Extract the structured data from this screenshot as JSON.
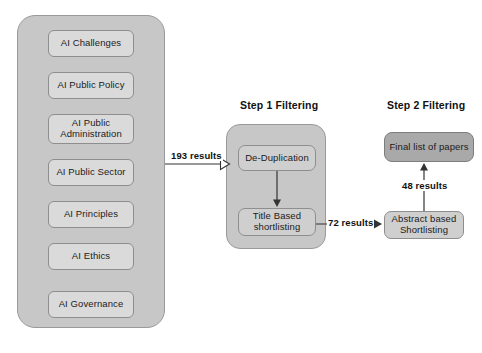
{
  "diagram": {
    "colors": {
      "group_fill": "#c7c7c7",
      "group_border": "#9a9a9a",
      "topic_fill": "#dadada",
      "process_fill": "#cfcfcf",
      "final_fill": "#a9a9a9",
      "box_border": "#8e8e8e",
      "text": "#1b1b1b",
      "line": "#333333",
      "background": "#ffffff"
    },
    "search_group": {
      "name": "search-terms-group",
      "items": [
        {
          "label": "AI Challenges"
        },
        {
          "label": "AI Public Policy"
        },
        {
          "label": "AI Public\nAdministration"
        },
        {
          "label": "AI Public Sector"
        },
        {
          "label": "AI Principles"
        },
        {
          "label": "AI Ethics"
        },
        {
          "label": "AI Governance"
        }
      ]
    },
    "step1": {
      "title": "Step 1 Filtering",
      "nodes": [
        {
          "label": "De-Duplication"
        },
        {
          "label": "Title Based\nshortlisting"
        }
      ]
    },
    "step2": {
      "title": "Step 2 Filtering",
      "nodes": [
        {
          "label": "Final list of papers"
        },
        {
          "label": "Abstract based\nShortlisting"
        }
      ]
    },
    "edges": [
      {
        "name": "edge-193-results",
        "label": "193 results",
        "arrow": "hollow",
        "direction": "right"
      },
      {
        "name": "edge-dedup-to-title",
        "label": "",
        "arrow": "solid",
        "direction": "down"
      },
      {
        "name": "edge-72-results",
        "label": "72 results",
        "arrow": "solid",
        "direction": "right"
      },
      {
        "name": "edge-48-results",
        "label": "48 results",
        "arrow": "solid",
        "direction": "up"
      }
    ]
  }
}
